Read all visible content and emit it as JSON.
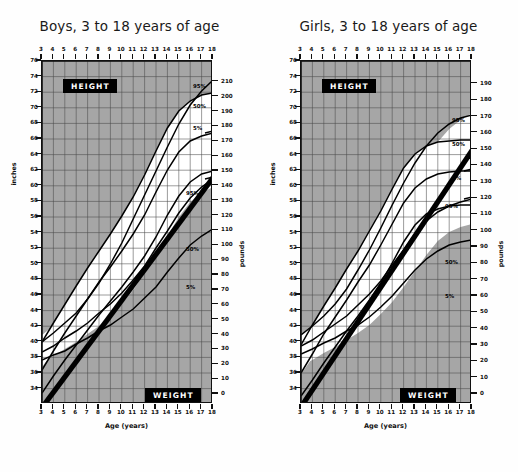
{
  "figure": {
    "kind": "growth-chart-pair"
  },
  "panels": [
    {
      "id": "boys",
      "title": "Boys, 3 to 18 years of age",
      "height_box": "HEIGHT",
      "weight_box": "WEIGHT",
      "left_axis_caption": "inches",
      "right_axis_caption": "pounds",
      "x_caption": "Age (years)",
      "height_pct_labels": [
        "95%",
        "50%",
        "5%"
      ],
      "weight_pct_labels": [
        "95%",
        "50%",
        "5%"
      ]
    },
    {
      "id": "girls",
      "title": "Girls, 3 to 18 years of age",
      "height_box": "HEIGHT",
      "weight_box": "WEIGHT",
      "left_axis_caption": "inches",
      "right_axis_caption": "pounds",
      "x_caption": "Age (years)",
      "height_pct_labels": [
        "95%",
        "50%",
        "5%"
      ],
      "weight_pct_labels": [
        "95%",
        "50%",
        "5%"
      ]
    }
  ],
  "chart_data": [
    {
      "type": "line",
      "id": "boys",
      "title": "Boys, 3 to 18 years of age",
      "xlabel": "Age (years)",
      "ylabel": "inches",
      "ylabel_right": "pounds",
      "xlim": [
        3,
        18
      ],
      "ylim_inches": [
        32,
        76
      ],
      "ylim_pounds": [
        0,
        210
      ],
      "x_ticks": [
        3,
        4,
        5,
        6,
        7,
        8,
        9,
        10,
        11,
        12,
        13,
        14,
        15,
        16,
        17,
        18
      ],
      "y_ticks_inches": [
        76,
        74,
        72,
        70,
        68,
        66,
        64,
        62,
        60,
        58,
        56,
        54,
        52,
        50,
        48,
        46,
        44,
        42,
        40,
        38,
        36,
        34
      ],
      "y_ticks_pounds": [
        210,
        200,
        190,
        180,
        170,
        160,
        150,
        140,
        130,
        120,
        110,
        100,
        90,
        80,
        70,
        60,
        50,
        40,
        30,
        20,
        10,
        0
      ],
      "grid": true,
      "legend": "inline-annotations",
      "x": [
        3,
        4,
        5,
        6,
        7,
        8,
        9,
        10,
        11,
        12,
        13,
        14,
        15,
        16,
        17,
        18
      ],
      "series": [
        {
          "name": "Height 95%",
          "unit": "inches",
          "values": [
            41.6,
            44.1,
            46.5,
            48.9,
            51.2,
            53.4,
            55.6,
            57.9,
            60.4,
            63.2,
            66.3,
            69.2,
            71.4,
            72.7,
            73.4,
            73.7
          ]
        },
        {
          "name": "Height 50%",
          "unit": "inches",
          "values": [
            38.0,
            40.4,
            42.8,
            45.0,
            47.2,
            49.3,
            51.3,
            53.4,
            55.6,
            58.1,
            61.0,
            63.9,
            66.2,
            67.6,
            68.3,
            68.7
          ]
        },
        {
          "name": "Height 5%",
          "unit": "inches",
          "values": [
            35.0,
            37.2,
            39.3,
            41.2,
            43.2,
            45.1,
            46.9,
            48.7,
            50.6,
            52.7,
            55.2,
            58.0,
            60.5,
            62.3,
            63.3,
            63.7
          ]
        },
        {
          "name": "Weight 95%",
          "unit": "pounds",
          "values": [
            38,
            44,
            50,
            57,
            66,
            76,
            88,
            101,
            116,
            131,
            146,
            161,
            175,
            187,
            196,
            203
          ]
        },
        {
          "name": "Weight 50%",
          "unit": "pounds",
          "values": [
            32,
            36,
            41,
            45,
            50,
            56,
            62,
            69,
            77,
            86,
            97,
            108,
            119,
            128,
            135,
            140
          ]
        },
        {
          "name": "Weight 5%",
          "unit": "pounds",
          "values": [
            27,
            30,
            33,
            37,
            41,
            45,
            49,
            54,
            59,
            66,
            73,
            82,
            91,
            99,
            105,
            109
          ]
        },
        {
          "name": "Reference diagonal",
          "unit": "mixed",
          "values": [
            null
          ]
        }
      ]
    },
    {
      "type": "line",
      "id": "girls",
      "title": "Girls, 3 to 18 years of age",
      "xlabel": "Age (years)",
      "ylabel": "inches",
      "ylabel_right": "pounds",
      "xlim": [
        3,
        18
      ],
      "ylim_inches": [
        32,
        76
      ],
      "ylim_pounds": [
        0,
        190
      ],
      "x_ticks": [
        3,
        4,
        5,
        6,
        7,
        8,
        9,
        10,
        11,
        12,
        13,
        14,
        15,
        16,
        17,
        18
      ],
      "y_ticks_inches": [
        76,
        74,
        72,
        70,
        68,
        66,
        64,
        62,
        60,
        58,
        56,
        54,
        52,
        50,
        48,
        46,
        44,
        42,
        40,
        38,
        36,
        34
      ],
      "y_ticks_pounds": [
        190,
        180,
        170,
        160,
        150,
        140,
        130,
        120,
        110,
        100,
        90,
        80,
        70,
        60,
        50,
        40,
        30,
        20,
        10,
        0
      ],
      "grid": true,
      "legend": "inline-annotations",
      "x": [
        3,
        4,
        5,
        6,
        7,
        8,
        9,
        10,
        11,
        12,
        13,
        14,
        15,
        16,
        17,
        18
      ],
      "series": [
        {
          "name": "Height 95%",
          "unit": "inches",
          "values": [
            41.2,
            43.8,
            46.2,
            48.6,
            51.0,
            53.4,
            55.9,
            58.6,
            61.5,
            64.2,
            66.0,
            67.0,
            67.5,
            67.7,
            67.8,
            67.8
          ]
        },
        {
          "name": "Height 50%",
          "unit": "inches",
          "values": [
            37.6,
            40.1,
            42.6,
            44.9,
            47.1,
            49.4,
            51.6,
            54.1,
            56.8,
            59.5,
            61.5,
            62.7,
            63.3,
            63.6,
            63.8,
            63.8
          ]
        },
        {
          "name": "Height 5%",
          "unit": "inches",
          "values": [
            34.6,
            36.7,
            38.9,
            41.0,
            43.0,
            45.0,
            47.0,
            49.2,
            51.8,
            54.5,
            56.7,
            58.1,
            58.8,
            59.1,
            59.3,
            59.3
          ]
        },
        {
          "name": "Weight 95%",
          "unit": "pounds",
          "values": [
            38,
            44,
            51,
            59,
            69,
            81,
            94,
            108,
            123,
            137,
            150,
            161,
            169,
            175,
            179,
            181
          ]
        },
        {
          "name": "Weight 50%",
          "unit": "pounds",
          "values": [
            31,
            35,
            40,
            45,
            50,
            57,
            64,
            72,
            82,
            92,
            102,
            110,
            116,
            120,
            123,
            125
          ]
        },
        {
          "name": "Weight 5%",
          "unit": "pounds",
          "values": [
            26,
            29,
            33,
            36,
            40,
            44,
            49,
            55,
            62,
            70,
            78,
            85,
            90,
            94,
            96,
            97
          ]
        },
        {
          "name": "Reference diagonal",
          "unit": "mixed",
          "values": [
            null
          ]
        }
      ]
    }
  ]
}
